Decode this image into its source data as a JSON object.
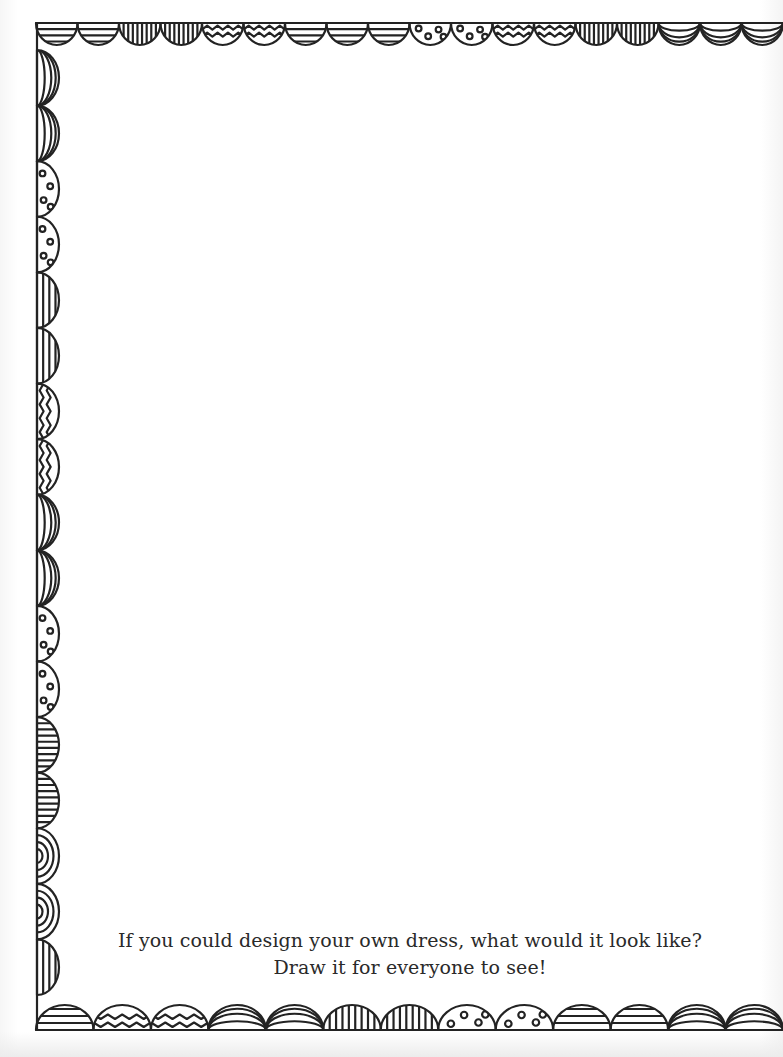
{
  "page": {
    "type": "coloring-activity-page",
    "background_color": "#ffffff",
    "ink_color": "#222222"
  },
  "border": {
    "style": "hand-drawn scalloped semicircles",
    "top": [
      "horizontal-stripes",
      "horizontal-stripes",
      "vertical-stripes",
      "vertical-stripes",
      "zigzag",
      "zigzag",
      "horizontal-stripes",
      "horizontal-stripes",
      "horizontal-stripes",
      "dots",
      "dots",
      "zigzag",
      "zigzag",
      "vertical-stripes",
      "vertical-stripes",
      "nested-arcs",
      "nested-arcs",
      "nested-arcs"
    ],
    "left": [
      "nested-arcs",
      "nested-arcs",
      "dots",
      "dots",
      "horizontal-stripes",
      "horizontal-stripes",
      "zigzag",
      "zigzag",
      "nested-arcs",
      "nested-arcs",
      "dots",
      "dots",
      "vertical-stripes",
      "vertical-stripes",
      "concentric-arcs",
      "concentric-arcs",
      "horizontal-stripes"
    ],
    "bottom": [
      "horizontal-stripes",
      "zigzag",
      "zigzag",
      "nested-arcs",
      "nested-arcs",
      "vertical-stripes",
      "vertical-stripes",
      "dots",
      "dots",
      "horizontal-stripes",
      "horizontal-stripes",
      "nested-arcs",
      "nested-arcs"
    ]
  },
  "prompt": {
    "line1": "If you could design your own dress, what would it look like?",
    "line2": "Draw it for everyone to see!"
  }
}
